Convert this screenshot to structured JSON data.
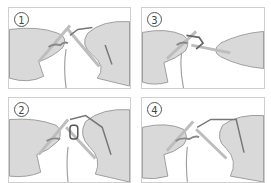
{
  "steps": [
    {
      "number": "1"
    },
    {
      "number": "2"
    },
    {
      "number": "3"
    },
    {
      "number": "4"
    }
  ],
  "colors": {
    "hand": "#d9d9d9",
    "hand_outline": "#8a8a8a",
    "needle": "#bdbdbd",
    "yarn": "#a0a0a0",
    "border": "#cfcfcf"
  }
}
